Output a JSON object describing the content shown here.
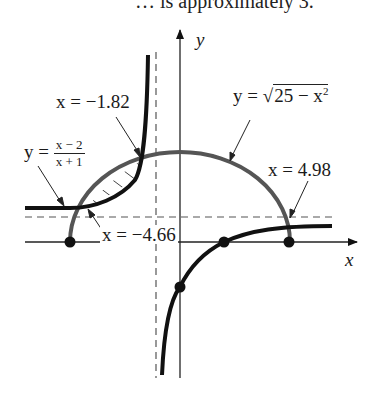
{
  "header": {
    "partial_text": "… is approximately 3."
  },
  "axes": {
    "x_label": "x",
    "y_label": "y"
  },
  "curves": {
    "hyperbola": {
      "label_lhs": "y =",
      "numerator": "x − 2",
      "denominator": "x + 1",
      "color": "#111111"
    },
    "semicircle": {
      "label_lhs": "y =",
      "radicand": "25 − x",
      "exponent": "2",
      "color": "#555555"
    }
  },
  "asymptotes": {
    "vertical": "x = −1",
    "horizontal": "y = 1",
    "style": "dashed"
  },
  "annotations": [
    {
      "id": "left-intersection",
      "text": "x = −1.82"
    },
    {
      "id": "lower-intersection",
      "text": "x = −4.66"
    },
    {
      "id": "right-intersection",
      "text": "x = 4.98"
    }
  ],
  "points": [
    {
      "name": "semicircle-left-endpoint",
      "x": -5,
      "y": 0
    },
    {
      "name": "semicircle-right-endpoint",
      "x": 5,
      "y": 0
    },
    {
      "name": "hyperbola-x-intercept",
      "x": 2,
      "y": 0
    },
    {
      "name": "hyperbola-y-intercept",
      "x": 0,
      "y": -2
    }
  ],
  "shaded_region": {
    "description": "region between curves from x = −4.66 to x = −1.82",
    "pattern": "hatched"
  }
}
